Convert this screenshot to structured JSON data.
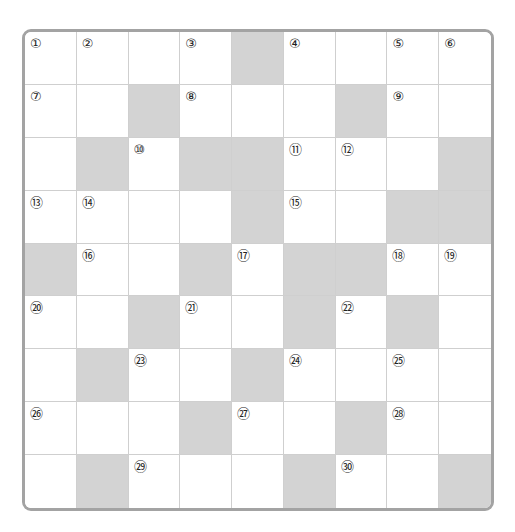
{
  "puzzle": {
    "rows": 9,
    "cols": 9,
    "colors": {
      "block": "#d3d3d3",
      "open": "#ffffff",
      "border": "#a3a3a3",
      "gridline": "#cfcfcf"
    },
    "grid": [
      [
        "①",
        "②",
        "",
        "③",
        "#",
        "④",
        "",
        "⑤",
        "⑥"
      ],
      [
        "⑦",
        "",
        "#",
        "⑧",
        "",
        "",
        "#",
        "⑨",
        ""
      ],
      [
        "",
        "#",
        "⑩",
        "#",
        "#",
        "⑪",
        "⑫",
        "",
        "#"
      ],
      [
        "⑬",
        "⑭",
        "",
        "",
        "#",
        "⑮",
        "",
        "#",
        "#"
      ],
      [
        "#",
        "⑯",
        "",
        "#",
        "⑰",
        "#",
        "#",
        "⑱",
        "⑲"
      ],
      [
        "⑳",
        "",
        "#",
        "㉑",
        "",
        "#",
        "㉒",
        "#",
        ""
      ],
      [
        "",
        "#",
        "㉓",
        "",
        "#",
        "㉔",
        "",
        "㉕",
        ""
      ],
      [
        "㉖",
        "",
        "",
        "#",
        "㉗",
        "",
        "#",
        "㉘",
        ""
      ],
      [
        "",
        "#",
        "㉙",
        "",
        "",
        "#",
        "㉚",
        "",
        "#"
      ]
    ]
  }
}
